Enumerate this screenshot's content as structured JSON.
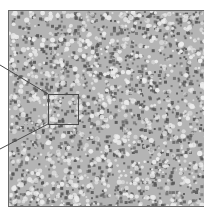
{
  "figure": {
    "main_image": {
      "description": "grayscale speckled texture micrograph",
      "x": 8,
      "y": 10,
      "width": 198,
      "height": 197,
      "colors": {
        "background": "#b4b4b4",
        "dark_speck": "#5a5a5a",
        "light_speck": "#ececec",
        "border": "#6a6a6a"
      }
    },
    "inset_box": {
      "x": 48,
      "y": 94,
      "width": 30,
      "height": 30,
      "stroke": "#4a4a4a"
    },
    "leader_lines": [
      {
        "x1": 0,
        "y1": 65,
        "x2": 48,
        "y2": 94
      },
      {
        "x1": 0,
        "y1": 149,
        "x2": 48,
        "y2": 124
      }
    ]
  }
}
